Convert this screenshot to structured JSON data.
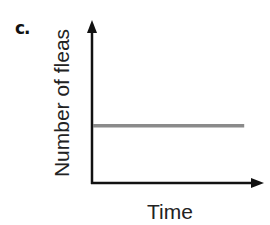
{
  "panel_label": "c.",
  "chart_data": {
    "type": "line",
    "title": "",
    "xlabel": "Time",
    "ylabel": "Number of fleas",
    "series": [
      {
        "name": "fleas",
        "x": [
          0,
          1
        ],
        "values": [
          0.37,
          0.37
        ],
        "color": "#8a8a8a"
      }
    ],
    "xlim": [
      0,
      1.13
    ],
    "ylim": [
      0,
      1
    ],
    "ticks": "none",
    "grid": false,
    "legend": "none",
    "annotation": "constant population over time"
  }
}
